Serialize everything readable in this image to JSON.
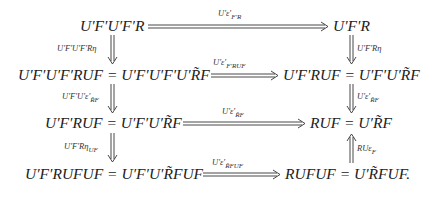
{
  "diagram": {
    "type": "commutative-diagram",
    "nodes": {
      "r1_left": "U′F′U′F′R",
      "r1_right": "U′F′R",
      "r2_left": "U′F′U′F′RUF = U′F′U′F′U′R̃F",
      "r2_right": "U′F′RUF = U′F′U′R̃F",
      "r3_left": "U′F′RUF = U′F′U′R̃F",
      "r3_right": "RUF = U′R̃F",
      "r4_left": "U′F′RUFUF = U′F′U′R̃FUF",
      "r4_right": "RUFUF = U′R̃FUF."
    },
    "horizontal_labels": {
      "h1": {
        "main": "U′ε′",
        "sub": "F′R"
      },
      "h2": {
        "main": "U′ε′",
        "sub": "F′RUF"
      },
      "h3": {
        "main": "U′ε′",
        "sub": "R̃F"
      },
      "h4": {
        "main": "U′ε′",
        "sub": "R̃FUF"
      }
    },
    "vertical_labels": {
      "left1": {
        "main": "U′F′U′F′Rη",
        "sub": ""
      },
      "left2": {
        "main": "U′F′U′ε′",
        "sub": "R̃F"
      },
      "left3": {
        "main": "U′F′Rη",
        "sub": "UF"
      },
      "right1": {
        "main": "U′F′Rη",
        "sub": ""
      },
      "right2": {
        "main": "U′ε′",
        "sub": "R̃F"
      },
      "right3": {
        "main": "RUε",
        "sub": "F"
      }
    },
    "arrow_style": "double-line (2-cell)"
  }
}
